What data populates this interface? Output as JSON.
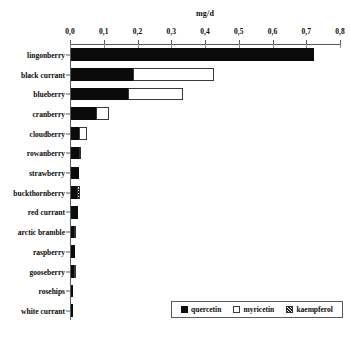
{
  "chart_data": {
    "type": "bar",
    "orientation": "horizontal",
    "stacked": true,
    "title": "mg/d",
    "xlabel": "mg/d",
    "ylabel": "",
    "xlim": [
      0,
      0.8
    ],
    "xticks": [
      0,
      0.1,
      0.2,
      0.3,
      0.4,
      0.5,
      0.6,
      0.7,
      0.8
    ],
    "xtick_labels": [
      "0,0",
      "0,1",
      "0,2",
      "0,3",
      "0,4",
      "0,5",
      "0,6",
      "0,7",
      "0,8"
    ],
    "grid": false,
    "legend_position": "bottom-right",
    "decimal_separator": ",",
    "categories": [
      "lingonberry",
      "black currant",
      "blueberry",
      "cranberry",
      "cloudberry",
      "rowanberry",
      "strawberry",
      "buckthornberry",
      "red currant",
      "arctic bramble",
      "raspberry",
      "gooseberry",
      "rosehips",
      "white currant"
    ],
    "series": [
      {
        "name": "quercetin",
        "color": "#0b0b0b",
        "values": [
          0.72,
          0.183,
          0.168,
          0.074,
          0.025,
          0.024,
          0.023,
          0.018,
          0.021,
          0.008,
          0.011,
          0.009,
          0.004,
          0.003
        ]
      },
      {
        "name": "myricetin",
        "color": "#ffffff",
        "values": [
          0.0,
          0.24,
          0.165,
          0.038,
          0.021,
          0.0,
          0.0,
          0.0,
          0.0,
          0.0,
          0.0,
          0.005,
          0.0,
          0.0
        ]
      },
      {
        "name": "kaempferol",
        "color": "#hatched",
        "values": [
          0.0,
          0.0,
          0.0,
          0.0,
          0.0,
          0.004,
          0.0,
          0.009,
          0.0,
          0.004,
          0.0,
          0.0,
          0.0,
          0.0
        ]
      }
    ],
    "totals": [
      0.72,
      0.423,
      0.333,
      0.112,
      0.046,
      0.028,
      0.023,
      0.027,
      0.021,
      0.012,
      0.011,
      0.014,
      0.004,
      0.003
    ]
  },
  "legend": {
    "items": [
      {
        "label": "quercetin",
        "swatch": "solid-black"
      },
      {
        "label": "myricetin",
        "swatch": "open-white"
      },
      {
        "label": "kaempferol",
        "swatch": "hatched"
      }
    ]
  }
}
